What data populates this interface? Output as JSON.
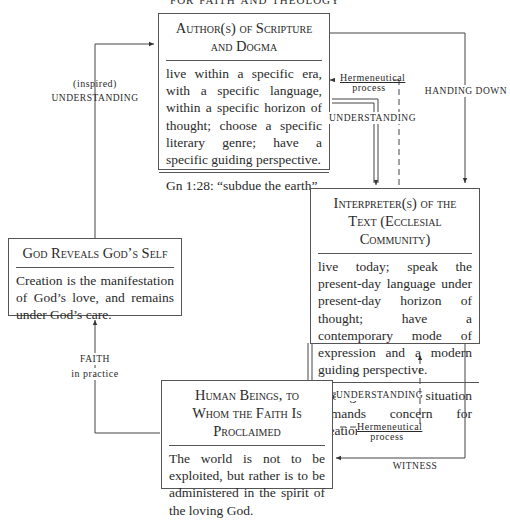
{
  "title": "for faith and theology",
  "boxes": {
    "author": {
      "heading": "Author(s) of Scripture and Dogma",
      "body": "live within a specific era, with a specific language, within a specific horizon of thought; choose a specific literary genre; have a specific guiding perspective.",
      "footer": "Gn 1:28: “subdue the earth”"
    },
    "interpreter": {
      "heading": "Interpreter(s) of the Text (Ecclesial Community)",
      "body": "live today; speak the present-day language under present-day horizon of thought; have a contemporary mode of expression and a modern guiding perspective.",
      "footer": "Ecological situation demands concern for creation"
    },
    "god": {
      "heading": "God Reveals God’s Self",
      "body": "Creation is the manifestation of God’s love, and remains under God’s care."
    },
    "human": {
      "heading": "Human Beings, to Whom the Faith Is Proclaimed",
      "body": "The world is not to be exploited, but rather is to be administered in the spirit of the loving God."
    }
  },
  "labels": {
    "inspired": "(inspired)",
    "understanding_left": "understanding",
    "hermeneutical_top_1": "Hermeneutical",
    "hermeneutical_top_2": "process",
    "understanding_top": "understanding",
    "handing_down": "handing down",
    "understanding_bottom": "understanding",
    "hermeneutical_bottom_1": "Hermeneutical",
    "hermeneutical_bottom_2": "process",
    "witness": "witness",
    "faith": "faith",
    "in_practice": "in practice"
  }
}
